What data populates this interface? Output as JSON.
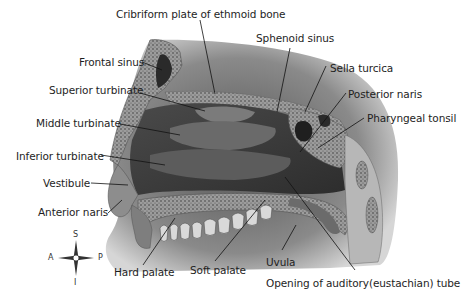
{
  "diagram": {
    "labels": {
      "cribriform": "Cribriform plate of ethmoid bone",
      "frontal_sinus": "Frontal sinus",
      "sphenoid_sinus": "Sphenoid sinus",
      "sella_turcica": "Sella turcica",
      "superior_turbinate": "Superior turbinate",
      "posterior_naris": "Posterior naris",
      "middle_turbinate": "Middle turbinate",
      "pharyngeal_tonsil": "Pharyngeal tonsil",
      "inferior_turbinate": "Inferior turbinate",
      "vestibule": "Vestibule",
      "anterior_naris": "Anterior naris",
      "hard_palate": "Hard palate",
      "soft_palate": "Soft palate",
      "uvula": "Uvula",
      "auditory_tube": "Opening of auditory(eustachian) tube"
    },
    "compass": {
      "superior": "S",
      "inferior": "I",
      "anterior": "A",
      "posterior": "P"
    },
    "colors": {
      "background": "#ffffff",
      "tissue_dark": "#3a3a3a",
      "tissue_mid": "#6e6e6e",
      "bone": "#a9a9a9",
      "label_text": "#1e1e1e",
      "leader_line": "#111111"
    }
  }
}
